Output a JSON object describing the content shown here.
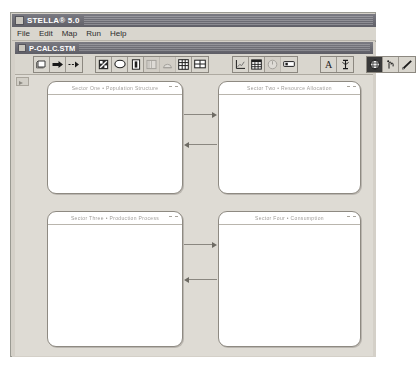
{
  "app": {
    "title": "STELLA® 5.0",
    "menu": [
      {
        "label": "File"
      },
      {
        "label": "Edit"
      },
      {
        "label": "Map"
      },
      {
        "label": "Run"
      },
      {
        "label": "Help"
      }
    ]
  },
  "document": {
    "title": "P-CALC.STM"
  },
  "toolbar": {
    "groups": [
      {
        "name": "structure-tools",
        "buttons": [
          {
            "icon": "stock-icon",
            "state": "normal"
          },
          {
            "icon": "flow-arrow-icon",
            "state": "normal"
          },
          {
            "icon": "connector-icon",
            "state": "normal"
          }
        ]
      },
      {
        "name": "object-tools",
        "buttons": [
          {
            "icon": "sector-frame-icon",
            "state": "normal"
          },
          {
            "icon": "converter-oval-icon",
            "state": "normal"
          },
          {
            "icon": "conveyor-icon",
            "state": "normal"
          },
          {
            "icon": "queue-icon",
            "state": "disabled"
          },
          {
            "icon": "oven-icon",
            "state": "disabled"
          },
          {
            "icon": "grid-icon",
            "state": "normal"
          },
          {
            "icon": "sector-grid-icon",
            "state": "normal"
          }
        ]
      },
      {
        "name": "display-tools",
        "buttons": [
          {
            "icon": "graph-pad-icon",
            "state": "normal"
          },
          {
            "icon": "table-pad-icon",
            "state": "normal"
          },
          {
            "icon": "dial-knob-icon",
            "state": "disabled"
          },
          {
            "icon": "slider-icon",
            "state": "normal"
          }
        ]
      },
      {
        "name": "annotation-tools",
        "buttons": [
          {
            "icon": "text-tool-icon",
            "state": "normal"
          },
          {
            "icon": "text-cursor-icon",
            "state": "normal"
          }
        ]
      },
      {
        "name": "pointer-tools",
        "buttons": [
          {
            "icon": "globe-hand-icon",
            "state": "selected"
          },
          {
            "icon": "hand-grab-icon",
            "state": "normal"
          },
          {
            "icon": "pencil-icon",
            "state": "normal"
          }
        ]
      }
    ]
  },
  "canvas": {
    "tab_icon": "ruler-tab-icon",
    "sectors": [
      {
        "id": "sector-top-left",
        "title": "Sector One  •  Population Structure"
      },
      {
        "id": "sector-top-right",
        "title": "Sector Two  •  Resource Allocation"
      },
      {
        "id": "sector-bottom-left",
        "title": "Sector Three  •  Production Process"
      },
      {
        "id": "sector-bottom-right",
        "title": "Sector Four  •  Consumption"
      }
    ],
    "connectors": [
      {
        "id": "connector-top-forward",
        "direction": "right"
      },
      {
        "id": "connector-top-reverse",
        "direction": "left"
      },
      {
        "id": "connector-bottom-forward",
        "direction": "right"
      },
      {
        "id": "connector-bottom-reverse",
        "direction": "left"
      }
    ]
  }
}
